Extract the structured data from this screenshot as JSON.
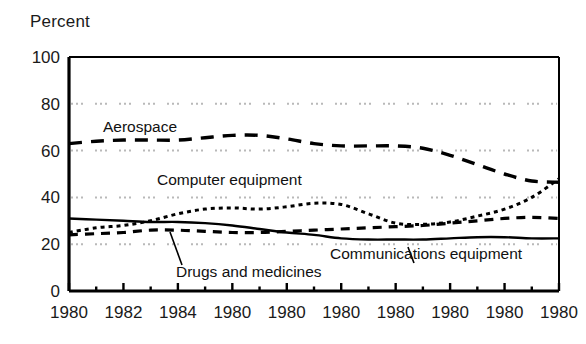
{
  "chart_data": {
    "type": "line",
    "title": "",
    "subtitle": "",
    "ylabel": "Percent",
    "xlabel": "",
    "ylim": [
      0,
      100
    ],
    "yticks": [
      0,
      20,
      40,
      60,
      80,
      100
    ],
    "grid": "horizontal dotted at 20, 40, 60, 80",
    "legend": "inline labels on plot",
    "xlim": [
      1980,
      1998
    ],
    "x": [
      1980,
      1981,
      1982,
      1983,
      1984,
      1985,
      1986,
      1987,
      1988,
      1989,
      1990,
      1991,
      1992,
      1993,
      1994,
      1995,
      1996,
      1997,
      1998
    ],
    "xticks": [
      1980,
      1982,
      1984,
      1986,
      1988,
      1990,
      1992,
      1994,
      1996,
      1998
    ],
    "xticklabels": [
      "1980",
      "1982",
      "1984",
      "1980",
      "1980",
      "1980",
      "1980",
      "1980",
      "1980",
      "1980"
    ],
    "series": [
      {
        "name": "Aerospace",
        "style": "long-dashed",
        "values": [
          63,
          64,
          64.5,
          64.5,
          64.5,
          65.5,
          66.5,
          66.5,
          65,
          63,
          62,
          62,
          62,
          61,
          58,
          54,
          50,
          47,
          46.5
        ]
      },
      {
        "name": "Computer equipment",
        "style": "fine-dotted",
        "values": [
          25,
          27,
          28,
          30,
          33,
          35,
          35.5,
          35,
          36,
          37.5,
          37,
          33,
          29,
          28.5,
          29.5,
          32,
          35,
          40,
          48
        ]
      },
      {
        "name": "Drugs and medicines",
        "style": "short-dashed",
        "values": [
          24,
          24.5,
          25,
          26,
          26,
          25.5,
          25,
          25,
          25.5,
          26,
          26.5,
          27,
          27.5,
          28,
          29,
          30,
          31,
          31.5,
          31
        ]
      },
      {
        "name": "Communications equipment",
        "style": "solid",
        "values": [
          31,
          30.5,
          30,
          29.5,
          29.5,
          29,
          28,
          26.5,
          25,
          24,
          22.5,
          22,
          22,
          22,
          22.5,
          23,
          23,
          22.5,
          22.5
        ]
      }
    ],
    "annotations": [
      {
        "name": "aerospace-label",
        "text": "Aerospace"
      },
      {
        "name": "computer-equipment-label",
        "text": "Computer equipment"
      },
      {
        "name": "drugs-and-medicines-label",
        "text": "Drugs and medicines"
      },
      {
        "name": "communications-equipment-label",
        "text": "Communications equipment"
      }
    ],
    "colors": {
      "line": "#000000",
      "grid": "#b9b9b9",
      "axis": "#000000",
      "background": "#ffffff"
    }
  }
}
